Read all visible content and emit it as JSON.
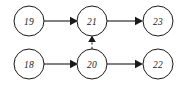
{
  "diagram": {
    "canvas": {
      "width": 184,
      "height": 87
    },
    "style": {
      "background_color": "#ffffff",
      "stroke_color": "#1a1a1a",
      "node_fill": "#ffffff",
      "node_radius": 15
    },
    "nodes": [
      {
        "id": "n19",
        "label": "19",
        "cx": 29,
        "cy": 21,
        "r": 15,
        "row": "top",
        "column": "left"
      },
      {
        "id": "n21",
        "label": "21",
        "cx": 92,
        "cy": 21,
        "r": 15,
        "row": "top",
        "column": "middle"
      },
      {
        "id": "n23",
        "label": "23",
        "cx": 158,
        "cy": 21,
        "r": 15,
        "row": "top",
        "column": "right"
      },
      {
        "id": "n18",
        "label": "18",
        "cx": 29,
        "cy": 64,
        "r": 15,
        "row": "bottom",
        "column": "left"
      },
      {
        "id": "n20",
        "label": "20",
        "cx": 92,
        "cy": 64,
        "r": 15,
        "row": "bottom",
        "column": "middle"
      },
      {
        "id": "n22",
        "label": "22",
        "cx": 158,
        "cy": 64,
        "r": 15,
        "row": "bottom",
        "column": "right"
      }
    ],
    "edges": [
      {
        "id": "e19_21",
        "from": "19",
        "to": "21",
        "style": "solid",
        "direction": "right",
        "arrow": "filled-triangle"
      },
      {
        "id": "e21_23",
        "from": "21",
        "to": "23",
        "style": "solid",
        "direction": "right",
        "arrow": "filled-triangle"
      },
      {
        "id": "e18_20",
        "from": "18",
        "to": "20",
        "style": "solid",
        "direction": "right",
        "arrow": "filled-triangle"
      },
      {
        "id": "e20_22",
        "from": "20",
        "to": "22",
        "style": "solid",
        "direction": "right",
        "arrow": "filled-triangle"
      },
      {
        "id": "e20_21",
        "from": "20",
        "to": "21",
        "style": "dashed",
        "direction": "up",
        "arrow": "filled-triangle"
      }
    ]
  }
}
